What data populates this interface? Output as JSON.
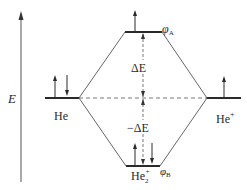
{
  "diagram": {
    "axis": {
      "label": "E"
    },
    "levels": {
      "left": {
        "label": "He",
        "electrons": [
          "up",
          "down"
        ]
      },
      "right": {
        "label": "He",
        "superscript": "+",
        "electrons": [
          "up"
        ]
      },
      "antibonding": {
        "label": "φ",
        "subscript": "A",
        "electrons": [
          "up"
        ]
      },
      "bonding": {
        "label": "φ",
        "subscript": "B",
        "electrons": [
          "up",
          "down"
        ],
        "molecule_label": "He",
        "molecule_subscript": "2",
        "molecule_superscript": "+"
      }
    },
    "gaps": {
      "upper": "ΔE",
      "lower": "−ΔE"
    },
    "colors": {
      "line": "#2a2a2a",
      "thin_line": "#555555"
    }
  }
}
